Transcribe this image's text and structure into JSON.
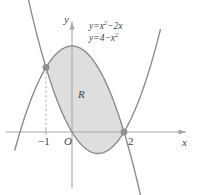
{
  "chart_data": {
    "type": "line",
    "title": "",
    "xlabel": "x",
    "ylabel": "y",
    "xlim": [
      -2.2,
      3.4
    ],
    "ylim": [
      -2.2,
      5.4
    ],
    "grid": false,
    "legend": "none",
    "series": [
      {
        "name": "y=x^2-2x",
        "label": "y=x²−2x",
        "type": "parabola-up",
        "color": "#8a8a8a",
        "equation_coefficients": {
          "a": 1,
          "b": -2,
          "c": 0
        },
        "vertex": [
          1,
          -1
        ],
        "roots": [
          0,
          2
        ]
      },
      {
        "name": "y=4-x^2",
        "label": "y=4−x²",
        "type": "parabola-down",
        "color": "#8a8a8a",
        "equation_coefficients": {
          "a": -1,
          "b": 0,
          "c": 4
        },
        "vertex": [
          0,
          4
        ],
        "roots": [
          -2,
          2
        ]
      }
    ],
    "intersections": [
      {
        "x": -1,
        "y": 3,
        "marked": true,
        "dashed_dropline": true
      },
      {
        "x": 2,
        "y": 0,
        "marked": true,
        "dashed_dropline": false
      }
    ],
    "shaded_region": {
      "label": "R",
      "fill_color": "#dedede",
      "between": [
        "y=4-x^2",
        "y=x^2-2x"
      ],
      "x_from": -1,
      "x_to": 2
    },
    "tick_labels": {
      "x": [
        "−1",
        "2"
      ],
      "origin": "O"
    },
    "axis_color": "#a0a0a0",
    "curve_color": "#8a8a8a",
    "marker_color": "#8f8f8f",
    "text_color": "#444444"
  },
  "labels": {
    "y_axis": "y",
    "x_axis": "x",
    "origin": "O",
    "tick_minus_one": "−1",
    "tick_two": "2",
    "region": "R",
    "equation_1_prefix": "y=x",
    "equation_1_exp": "2",
    "equation_1_suffix": "−2x",
    "equation_2_prefix": "y=4−x",
    "equation_2_exp": "2"
  }
}
